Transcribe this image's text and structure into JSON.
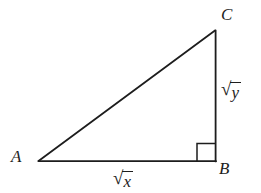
{
  "figure": {
    "kind": "geometry-diagram",
    "background_color": "#ffffff",
    "stroke_color": "#1d1d1d",
    "stroke_width": 1.7,
    "canvas": {
      "width": 261,
      "height": 193
    },
    "vertices": [
      {
        "id": "A",
        "label": "A",
        "x": 38,
        "y": 161
      },
      {
        "id": "B",
        "label": "B",
        "x": 216,
        "y": 161
      },
      {
        "id": "C",
        "label": "C",
        "x": 215,
        "y": 30
      }
    ],
    "edges": [
      {
        "id": "AB",
        "from": "A",
        "to": "B",
        "role": "base",
        "length_label": "√x"
      },
      {
        "id": "BC",
        "from": "B",
        "to": "C",
        "role": "height",
        "length_label": "√y"
      },
      {
        "id": "CA",
        "from": "C",
        "to": "A",
        "role": "hypotenuse",
        "length_label": ""
      }
    ],
    "right_angle_marker": {
      "at_vertex": "B",
      "shape": "square",
      "size": 18,
      "x": 197,
      "y": 143
    },
    "labels": {
      "vertex_a": "A",
      "vertex_b": "B",
      "vertex_c": "C",
      "side_ab_radical_sign": "√",
      "side_ab_radicand": "x",
      "side_bc_radical_sign": "√",
      "side_bc_radicand": "y"
    }
  }
}
